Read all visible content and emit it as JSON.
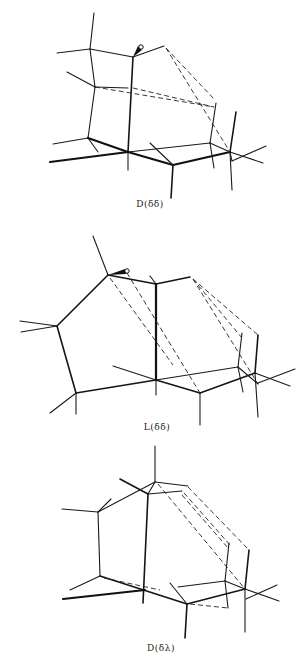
{
  "header": {
    "text": ""
  },
  "figures": [
    {
      "id": "conformer-1",
      "label": "D(δδ)"
    },
    {
      "id": "conformer-2",
      "label": "L(δδ)"
    },
    {
      "id": "conformer-3",
      "label": "D(δλ)"
    }
  ],
  "colors": {
    "ink": "#111111",
    "background": "#ffffff"
  }
}
